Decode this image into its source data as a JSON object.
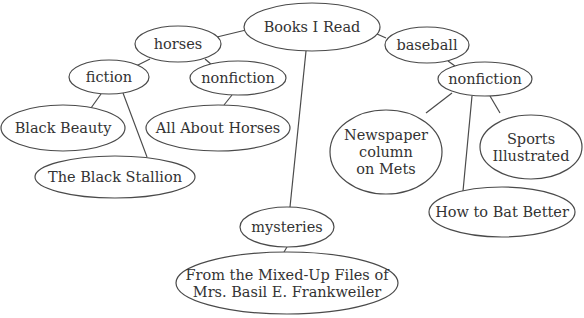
{
  "diagram": {
    "type": "concept-web",
    "title": "Books I Read",
    "nodes": [
      {
        "id": "root",
        "lines": [
          "Books I Read"
        ],
        "cx": 312,
        "cy": 27,
        "rx": 68,
        "ry": 24
      },
      {
        "id": "horses",
        "lines": [
          "horses"
        ],
        "cx": 178,
        "cy": 44,
        "rx": 43,
        "ry": 18
      },
      {
        "id": "horses-fiction",
        "lines": [
          "fiction"
        ],
        "cx": 109,
        "cy": 77,
        "rx": 40,
        "ry": 17
      },
      {
        "id": "horses-nonfiction",
        "lines": [
          "nonfiction"
        ],
        "cx": 238,
        "cy": 78,
        "rx": 48,
        "ry": 17
      },
      {
        "id": "black-beauty",
        "lines": [
          "Black Beauty"
        ],
        "cx": 63,
        "cy": 128,
        "rx": 62,
        "ry": 23
      },
      {
        "id": "all-about-horses",
        "lines": [
          "All About Horses"
        ],
        "cx": 218,
        "cy": 128,
        "rx": 72,
        "ry": 23
      },
      {
        "id": "black-stallion",
        "lines": [
          "The Black Stallion"
        ],
        "cx": 115,
        "cy": 177,
        "rx": 80,
        "ry": 21
      },
      {
        "id": "baseball",
        "lines": [
          "baseball"
        ],
        "cx": 427,
        "cy": 45,
        "rx": 42,
        "ry": 18
      },
      {
        "id": "baseball-nonfiction",
        "lines": [
          "nonfiction"
        ],
        "cx": 485,
        "cy": 79,
        "rx": 47,
        "ry": 17
      },
      {
        "id": "newspaper-column",
        "lines": [
          "Newspaper",
          "column",
          "on Mets"
        ],
        "cx": 386,
        "cy": 152,
        "rx": 56,
        "ry": 42
      },
      {
        "id": "sports-illustrated",
        "lines": [
          "Sports",
          "Illustrated"
        ],
        "cx": 531,
        "cy": 147,
        "rx": 51,
        "ry": 32
      },
      {
        "id": "how-to-bat",
        "lines": [
          "How to Bat Better"
        ],
        "cx": 502,
        "cy": 212,
        "rx": 73,
        "ry": 25
      },
      {
        "id": "mysteries",
        "lines": [
          "mysteries"
        ],
        "cx": 287,
        "cy": 227,
        "rx": 47,
        "ry": 20
      },
      {
        "id": "mixed-up-files",
        "lines": [
          "From the Mixed-Up Files of",
          "Mrs. Basil E. Frankweiler"
        ],
        "cx": 287,
        "cy": 283,
        "rx": 111,
        "ry": 31
      }
    ],
    "edges": [
      {
        "from": "root",
        "to": "horses",
        "x1": 246,
        "y1": 30,
        "x2": 217,
        "y2": 37
      },
      {
        "from": "root",
        "to": "baseball",
        "x1": 377,
        "y1": 34,
        "x2": 386,
        "y2": 38
      },
      {
        "from": "root",
        "to": "mysteries",
        "x1": 306,
        "y1": 51,
        "x2": 290,
        "y2": 207
      },
      {
        "from": "horses",
        "to": "horses-fiction",
        "x1": 150,
        "y1": 59,
        "x2": 136,
        "y2": 66
      },
      {
        "from": "horses",
        "to": "horses-nonfiction",
        "x1": 205,
        "y1": 59,
        "x2": 212,
        "y2": 65
      },
      {
        "from": "horses-fiction",
        "to": "black-beauty",
        "x1": 101,
        "y1": 94,
        "x2": 91,
        "y2": 108
      },
      {
        "from": "horses-fiction",
        "to": "black-stallion",
        "x1": 123,
        "y1": 93,
        "x2": 147,
        "y2": 157
      },
      {
        "from": "horses-nonfiction",
        "to": "all-about-horses",
        "x1": 232,
        "y1": 95,
        "x2": 224,
        "y2": 105
      },
      {
        "from": "baseball",
        "to": "baseball-nonfiction",
        "x1": 448,
        "y1": 61,
        "x2": 455,
        "y2": 66
      },
      {
        "from": "baseball-nonfiction",
        "to": "newspaper-column",
        "x1": 452,
        "y1": 93,
        "x2": 426,
        "y2": 113
      },
      {
        "from": "baseball-nonfiction",
        "to": "how-to-bat",
        "x1": 472,
        "y1": 96,
        "x2": 463,
        "y2": 191
      },
      {
        "from": "baseball-nonfiction",
        "to": "sports-illustrated",
        "x1": 490,
        "y1": 96,
        "x2": 500,
        "y2": 113
      },
      {
        "from": "mysteries",
        "to": "mixed-up-files",
        "x1": 287,
        "y1": 247,
        "x2": 284,
        "y2": 252
      }
    ]
  }
}
